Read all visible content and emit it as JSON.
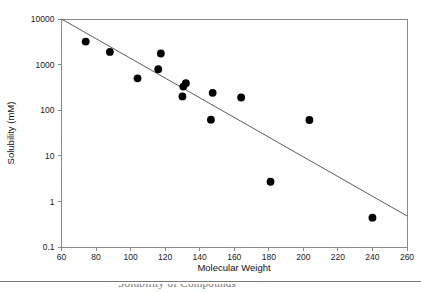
{
  "chart_data": {
    "type": "scatter",
    "title": "",
    "xlabel": "Molecular Weight",
    "ylabel": "Solubility (mM)",
    "xlim": [
      60,
      260
    ],
    "ylim": [
      0.1,
      10000
    ],
    "yscale": "log",
    "xscale": "linear",
    "grid": false,
    "legend": null,
    "xticks": [
      60,
      80,
      100,
      120,
      140,
      160,
      180,
      200,
      220,
      240,
      260
    ],
    "xtick_labels": [
      "60",
      "80",
      "100",
      "120",
      "140",
      "160",
      "180",
      "200",
      "220",
      "240",
      "260"
    ],
    "yticks": [
      0.1,
      1,
      10,
      100,
      1000,
      10000
    ],
    "ytick_labels": [
      "0.1",
      "1",
      "10",
      "100",
      "1000",
      "10000"
    ],
    "series": [
      {
        "name": "Compounds",
        "marker": "filled-circle",
        "marker_color": "#000000",
        "marker_size": 5.2,
        "points": [
          {
            "x": 74,
            "y": 3200
          },
          {
            "x": 88,
            "y": 1900
          },
          {
            "x": 104,
            "y": 500
          },
          {
            "x": 116,
            "y": 790
          },
          {
            "x": 117.5,
            "y": 1750
          },
          {
            "x": 130,
            "y": 200
          },
          {
            "x": 130.5,
            "y": 330
          },
          {
            "x": 132,
            "y": 390
          },
          {
            "x": 146.5,
            "y": 62
          },
          {
            "x": 147.5,
            "y": 240
          },
          {
            "x": 164,
            "y": 190
          },
          {
            "x": 181,
            "y": 2.7
          },
          {
            "x": 203.5,
            "y": 61
          },
          {
            "x": 240,
            "y": 0.44
          }
        ]
      }
    ],
    "fit_line": {
      "name": "Regression line",
      "color": "#4a4a4a",
      "x_start": 60,
      "y_start": 10000,
      "x_end": 260,
      "y_end": 0.48
    }
  },
  "footer": {
    "clipped_caption": "Solubility of Compounds"
  }
}
